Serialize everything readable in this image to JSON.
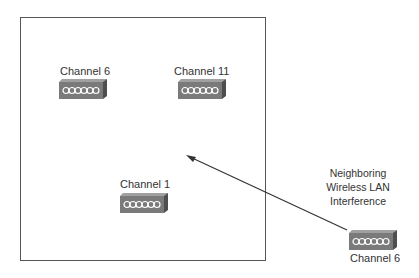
{
  "diagram": {
    "type": "wireless-channel-interference",
    "coverage_area": {
      "access_points": [
        {
          "label": "Channel 6"
        },
        {
          "label": "Channel 11"
        },
        {
          "label": "Channel 1"
        }
      ]
    },
    "external_access_point": {
      "label": "Channel 6"
    },
    "interference_note": {
      "lines": [
        "Neighboring",
        "Wireless LAN",
        "Interference"
      ]
    },
    "colors": {
      "ap_front": "#7a7a7a",
      "ap_side": "#5a5a5a",
      "ap_top": "#a0a0a0",
      "border": "#555555",
      "arrow": "#333333"
    }
  }
}
